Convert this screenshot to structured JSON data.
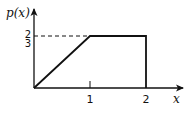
{
  "diagram": {
    "type": "piecewise-density-plot",
    "y_axis_label": "p(x)",
    "x_axis_label": "x",
    "x_ticks": [
      "1",
      "2"
    ],
    "y_tick": {
      "numerator": "2",
      "denominator": "3"
    },
    "segments": [
      {
        "from": [
          0,
          0
        ],
        "to": [
          1,
          0.6667
        ],
        "style": "solid"
      },
      {
        "from": [
          1,
          0.6667
        ],
        "to": [
          2,
          0.6667
        ],
        "style": "solid"
      },
      {
        "from": [
          2,
          0.6667
        ],
        "to": [
          2,
          0
        ],
        "style": "solid"
      },
      {
        "from": [
          0,
          0.6667
        ],
        "to": [
          1,
          0.6667
        ],
        "style": "dashed"
      }
    ],
    "colors": {
      "line": "#111111",
      "background": "#ffffff"
    }
  }
}
